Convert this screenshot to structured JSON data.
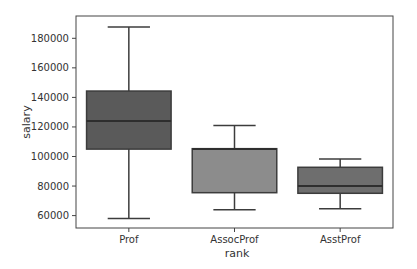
{
  "chart_data": {
    "type": "box",
    "title": "",
    "xlabel": "rank",
    "ylabel": "salary",
    "ylim": [
      52000,
      196000
    ],
    "yticks": [
      60000,
      80000,
      100000,
      120000,
      140000,
      160000,
      180000
    ],
    "ytick_labels": [
      "60000",
      "80000",
      "100000",
      "120000",
      "140000",
      "160000",
      "180000"
    ],
    "categories": [
      "Prof",
      "AssocProf",
      "AsstProf"
    ],
    "boxes": [
      {
        "category": "Prof",
        "whisker_low": 58000,
        "q1": 105000,
        "median": 124000,
        "q3": 144300,
        "whisker_high": 187600,
        "color": "#5a5a5a"
      },
      {
        "category": "AssocProf",
        "whisker_low": 64000,
        "q1": 75500,
        "median": 105000,
        "q3": 105300,
        "whisker_high": 120900,
        "color": "#8c8c8c"
      },
      {
        "category": "AsstProf",
        "whisker_low": 64700,
        "q1": 75100,
        "median": 80000,
        "q3": 92700,
        "whisker_high": 98300,
        "color": "#6e6e6e"
      }
    ],
    "grid": false,
    "legend": null
  }
}
